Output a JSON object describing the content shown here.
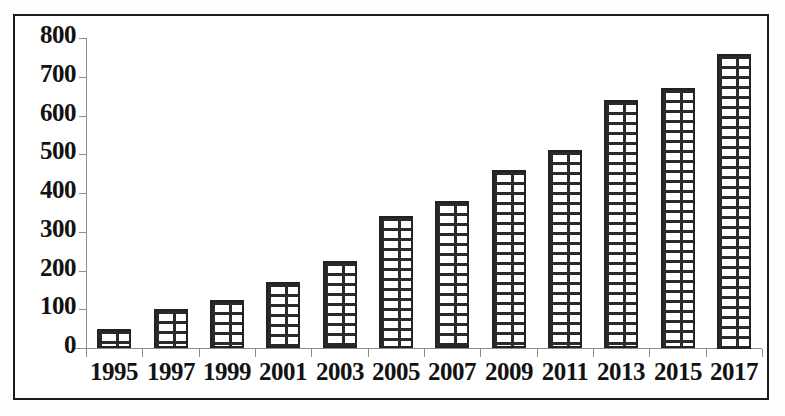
{
  "chart_data": {
    "type": "bar",
    "title": "",
    "subtitle": "",
    "xlabel": "",
    "ylabel": "",
    "ylim": [
      0,
      800
    ],
    "yticks": [
      0,
      100,
      200,
      300,
      400,
      500,
      600,
      700,
      800
    ],
    "ytick_labels": [
      "0",
      "100",
      "200",
      "300",
      "400",
      "500",
      "600",
      "700",
      "800"
    ],
    "grid": false,
    "legend": null,
    "bar_style": "brick-hatch-pattern",
    "bar_fill": "#ffffff",
    "bar_edge": "#222222",
    "categories": [
      "1995",
      "1997",
      "1999",
      "2001",
      "2003",
      "2005",
      "2007",
      "2009",
      "2011",
      "2013",
      "2015",
      "2017"
    ],
    "values": [
      50,
      100,
      125,
      170,
      225,
      340,
      380,
      460,
      510,
      640,
      670,
      760
    ],
    "series": [
      {
        "name": "",
        "values": [
          50,
          100,
          125,
          170,
          225,
          340,
          380,
          460,
          510,
          640,
          670,
          760
        ]
      }
    ],
    "annotations": []
  },
  "figure": {
    "border_color": "#1b1b1b",
    "background": "#ffffff",
    "axis_color": "#8d8d8d",
    "text_color": "#121212"
  }
}
